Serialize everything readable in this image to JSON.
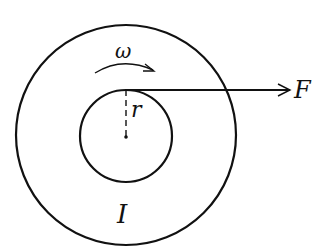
{
  "diagram": {
    "type": "rotating-disk-with-applied-force",
    "labels": {
      "angular_velocity": "ω",
      "radius": "r",
      "force": "F",
      "moment_of_inertia": "I"
    },
    "colors": {
      "stroke": "#111111",
      "background": "#ffffff"
    }
  }
}
